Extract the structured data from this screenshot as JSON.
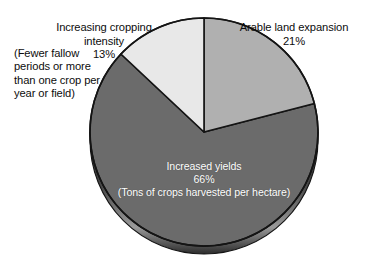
{
  "chart_data": {
    "type": "pie",
    "title": "",
    "subtitle": "",
    "xlabel": "",
    "ylabel": "",
    "legend_position": "none",
    "grid": false,
    "start_angle_deg": 0,
    "direction": "clockwise",
    "unit": "%",
    "categories": [
      "Arable land expansion",
      "Increased yields",
      "Increasing cropping intensity"
    ],
    "values": [
      21,
      66,
      13
    ],
    "slices": [
      {
        "label": "Arable land expansion",
        "value": 21,
        "value_text": "21%",
        "color": "#b0b0b0",
        "note": "",
        "label_placement": "outside-right"
      },
      {
        "label": "Increased yields",
        "value": 66,
        "value_text": "66%",
        "color": "#6b6b6b",
        "note": "(Tons of crops harvested per hectare)",
        "label_placement": "inside"
      },
      {
        "label": "Increasing cropping intensity",
        "value": 13,
        "value_text": "13%",
        "color": "#e8e8e8",
        "note": "(Fewer fallow periods or more than one crop per year or field)",
        "label_placement": "outside-left"
      }
    ],
    "annotations": [
      "(Fewer fallow periods or more than one crop per year or field)",
      "(Tons of crops harvested per hectare)"
    ]
  },
  "labels": {
    "cropping": {
      "title": "Increasing cropping\nintensity",
      "percent": "13%",
      "note": "(Fewer fallow\nperiods or more\nthan one crop per\nyear or field)"
    },
    "arable": {
      "title": "Arable land expansion",
      "percent": "21%"
    },
    "yields": {
      "title": "Increased yields",
      "percent": "66%",
      "note": "(Tons of crops harvested per hectare)"
    }
  },
  "style": {
    "background": "#ffffff",
    "outline": "#1a1a1a",
    "text": "#0d0d0d",
    "inside_text": "#ffffff",
    "slice_arable": "#b0b0b0",
    "slice_yields": "#6b6b6b",
    "slice_cropping": "#e8e8e8",
    "rim_shadow": "#2b2b2b"
  }
}
